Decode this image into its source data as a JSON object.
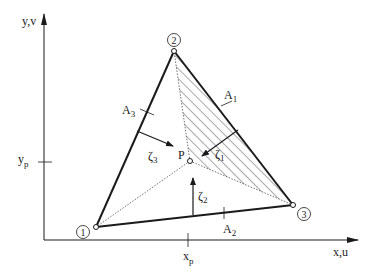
{
  "diagram": {
    "colors": {
      "stroke": "#1a1a1a",
      "hatch": "#444444",
      "background": "#ffffff"
    },
    "axes": {
      "y_label": "y,v",
      "x_label": "x,u",
      "y_tick_label": "y",
      "y_tick_sub": "p",
      "x_tick_label": "x",
      "x_tick_sub": "p"
    },
    "nodes": [
      {
        "id": "1",
        "label": "1",
        "x": 96,
        "y": 227
      },
      {
        "id": "2",
        "label": "2",
        "x": 174,
        "y": 51
      },
      {
        "id": "3",
        "label": "3",
        "x": 293,
        "y": 205
      }
    ],
    "point": {
      "label": "P",
      "x": 190,
      "y": 161
    },
    "areas": [
      {
        "label": "A",
        "sub": "1",
        "hatched": true
      },
      {
        "label": "A",
        "sub": "2",
        "hatched": false
      },
      {
        "label": "A",
        "sub": "3",
        "hatched": false
      }
    ],
    "distances": [
      {
        "label": "ζ",
        "sub": "1"
      },
      {
        "label": "ζ",
        "sub": "2"
      },
      {
        "label": "ζ",
        "sub": "3"
      }
    ]
  }
}
